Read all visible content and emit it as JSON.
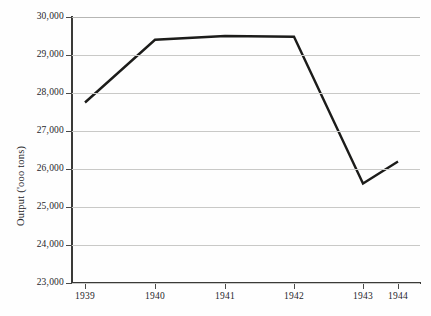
{
  "chart_data": {
    "type": "line",
    "title": "",
    "xlabel": "",
    "ylabel": "Output ('ooo tons)",
    "categories": [
      "1939",
      "1940",
      "1941",
      "1942",
      "1943",
      "1944"
    ],
    "x": [
      1939,
      1940,
      1941,
      1942,
      1943,
      1944
    ],
    "values": [
      27750,
      29400,
      29500,
      29480,
      25620,
      26200
    ],
    "series": [
      {
        "name": "Output",
        "values": [
          27750,
          29400,
          29500,
          29480,
          25620,
          26200
        ]
      }
    ],
    "ylim": [
      23000,
      30000
    ],
    "ytick_values": [
      23000,
      24000,
      25000,
      26000,
      27000,
      28000,
      29000,
      30000
    ],
    "ytick_labels": [
      "23,000",
      "24,000",
      "25,000",
      "26,000",
      "27,000",
      "28,000",
      "29,000",
      "30,000"
    ],
    "xtick_labels": [
      "1939",
      "1940",
      "1941",
      "1942",
      "1943",
      "1944"
    ],
    "grid": true,
    "legend": false,
    "legend_position": "none",
    "line_color": "#1c1c1a",
    "grid_color": "#c9c9c7",
    "axis_color": "#3a3a38",
    "background_color": "#fefefe"
  },
  "axis": {
    "y_title": "Output ('ooo tons)"
  }
}
